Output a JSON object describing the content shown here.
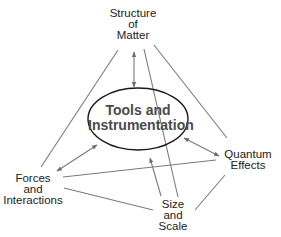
{
  "diagram": {
    "type": "concept-map",
    "center": {
      "lines": [
        "Tools and",
        "Instrumentation"
      ]
    },
    "nodes": {
      "structure": {
        "lines": [
          "Structure",
          "of",
          "Matter"
        ]
      },
      "forces": {
        "lines": [
          "Forces",
          "and",
          "Interactions"
        ]
      },
      "quantum": {
        "lines": [
          "Quantum",
          "Effects"
        ]
      },
      "size": {
        "lines": [
          "Size",
          "and",
          "Scale"
        ]
      }
    },
    "connections": [
      {
        "from": "Structure of Matter",
        "to": "Tools and Instrumentation",
        "type": "double-arrow"
      },
      {
        "from": "Forces and Interactions",
        "to": "Tools and Instrumentation",
        "type": "double-arrow"
      },
      {
        "from": "Quantum Effects",
        "to": "Tools and Instrumentation",
        "type": "double-arrow"
      },
      {
        "from": "Size and Scale",
        "to": "Tools and Instrumentation",
        "type": "arrow"
      },
      {
        "from": "Structure of Matter",
        "to": "Forces and Interactions",
        "type": "line"
      },
      {
        "from": "Structure of Matter",
        "to": "Quantum Effects",
        "type": "line"
      },
      {
        "from": "Structure of Matter",
        "to": "Size and Scale",
        "type": "line"
      },
      {
        "from": "Forces and Interactions",
        "to": "Quantum Effects",
        "type": "line"
      },
      {
        "from": "Forces and Interactions",
        "to": "Size and Scale",
        "type": "line"
      },
      {
        "from": "Size and Scale",
        "to": "Quantum Effects",
        "type": "line"
      }
    ],
    "colors": {
      "line": "#7a7a7a",
      "ellipse": "#1a1a1a",
      "text": "#222222",
      "center_text": "#4a4a4a"
    }
  }
}
